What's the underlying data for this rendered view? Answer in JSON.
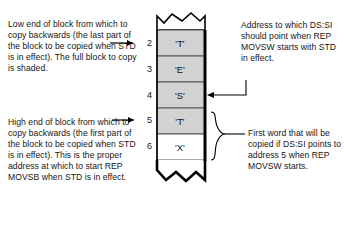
{
  "diagram": {
    "notes": {
      "low_end": "Low end of block from which to copy backwards (the last part of the block to be copied when STD is in effect). The full block to copy is shaded.",
      "high_end": "High end of block from which to copy backwards (the first part of the block to be copied when STD is in effect). This is the proper address at which to start REP MOVSB when STD is in effect.",
      "ds_si_address": "Address to which DS:SI should point when REP MOVSW starts with STD in effect.",
      "first_word": "First word that will be copied if DS:SI points to address 5 when REP MOVSW starts."
    },
    "memory": {
      "rows": [
        {
          "address": "2",
          "value": "'T'",
          "shaded": true
        },
        {
          "address": "3",
          "value": "'E'",
          "shaded": true
        },
        {
          "address": "4",
          "value": "'S'",
          "shaded": true
        },
        {
          "address": "5",
          "value": "'T'",
          "shaded": true
        },
        {
          "address": "6",
          "value": "'X'",
          "shaded": false
        }
      ],
      "shaded_color": "#d0d0d0",
      "unshaded_color": "#ffffff",
      "outline_color": "#000000"
    },
    "connectors": {
      "low_end_arrow_target": "2",
      "high_end_arrow_target": "5",
      "ds_si_arrow_target": "4",
      "first_word_brace_span": [
        "5",
        "6"
      ]
    }
  }
}
